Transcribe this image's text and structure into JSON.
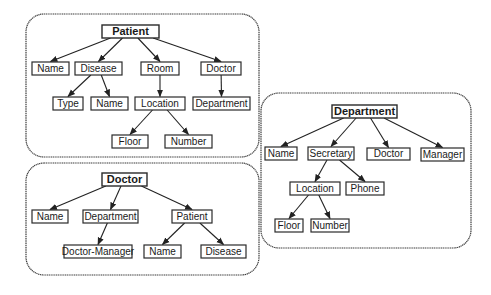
{
  "diagram": {
    "type": "hierarchy-trees",
    "trees": [
      {
        "id": "patient",
        "root": "Patient",
        "nodes": [
          {
            "id": "p_root",
            "label": "Patient",
            "parent": null
          },
          {
            "id": "p_name",
            "label": "Name",
            "parent": "p_root"
          },
          {
            "id": "p_disease",
            "label": "Disease",
            "parent": "p_root"
          },
          {
            "id": "p_room",
            "label": "Room",
            "parent": "p_root"
          },
          {
            "id": "p_doctor",
            "label": "Doctor",
            "parent": "p_root"
          },
          {
            "id": "p_type",
            "label": "Type",
            "parent": "p_disease"
          },
          {
            "id": "p_dname",
            "label": "Name",
            "parent": "p_disease"
          },
          {
            "id": "p_location",
            "label": "Location",
            "parent": "p_room"
          },
          {
            "id": "p_department",
            "label": "Department",
            "parent": "p_doctor"
          },
          {
            "id": "p_floor",
            "label": "Floor",
            "parent": "p_location"
          },
          {
            "id": "p_number",
            "label": "Number",
            "parent": "p_location"
          }
        ]
      },
      {
        "id": "doctor",
        "root": "Doctor",
        "nodes": [
          {
            "id": "d_root",
            "label": "Doctor",
            "parent": null
          },
          {
            "id": "d_name",
            "label": "Name",
            "parent": "d_root"
          },
          {
            "id": "d_department",
            "label": "Department",
            "parent": "d_root"
          },
          {
            "id": "d_patient",
            "label": "Patient",
            "parent": "d_root"
          },
          {
            "id": "d_docmgr",
            "label": "Doctor-Manager",
            "parent": "d_department"
          },
          {
            "id": "d_pname",
            "label": "Name",
            "parent": "d_patient"
          },
          {
            "id": "d_pdisease",
            "label": "Disease",
            "parent": "d_patient"
          }
        ]
      },
      {
        "id": "department",
        "root": "Department",
        "nodes": [
          {
            "id": "t_root",
            "label": "Department",
            "parent": null
          },
          {
            "id": "t_name",
            "label": "Name",
            "parent": "t_root"
          },
          {
            "id": "t_secretary",
            "label": "Secretary",
            "parent": "t_root"
          },
          {
            "id": "t_doctor",
            "label": "Doctor",
            "parent": "t_root"
          },
          {
            "id": "t_manager",
            "label": "Manager",
            "parent": "t_root"
          },
          {
            "id": "t_location",
            "label": "Location",
            "parent": "t_secretary"
          },
          {
            "id": "t_phone",
            "label": "Phone",
            "parent": "t_secretary"
          },
          {
            "id": "t_floor",
            "label": "Floor",
            "parent": "t_location"
          },
          {
            "id": "t_number",
            "label": "Number",
            "parent": "t_location"
          }
        ]
      }
    ]
  }
}
